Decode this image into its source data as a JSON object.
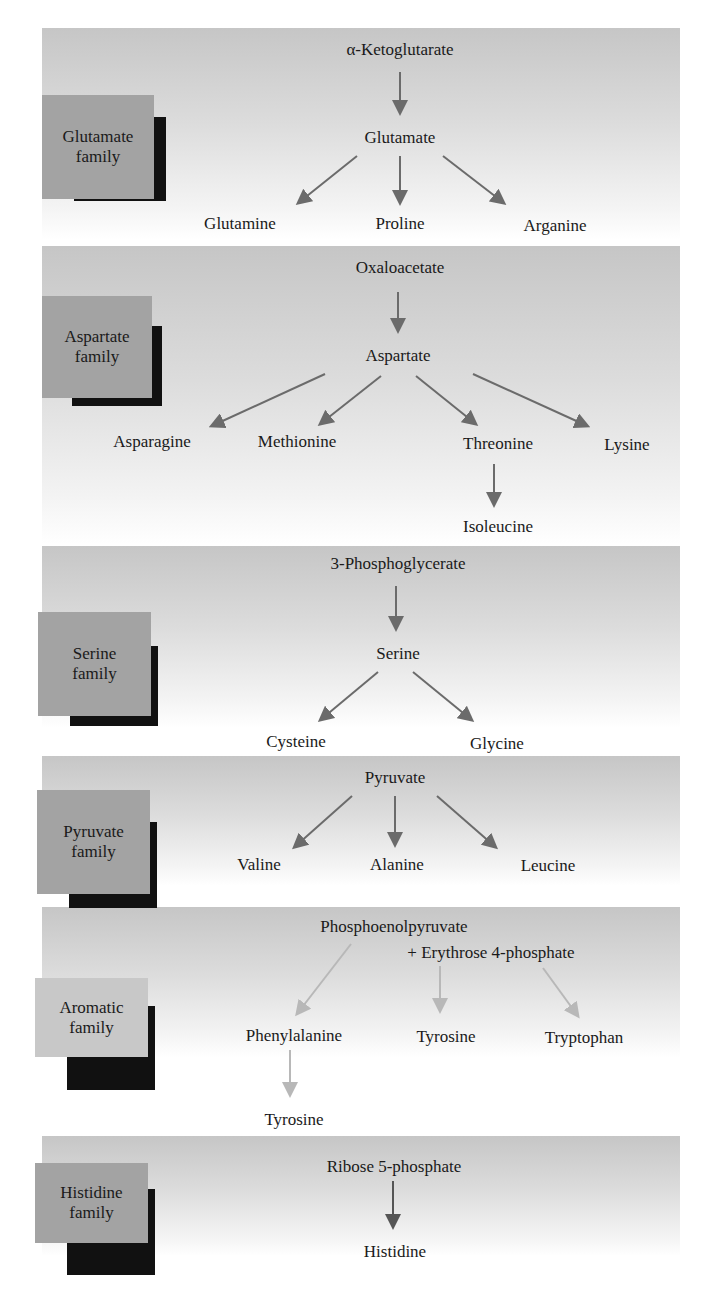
{
  "colors": {
    "badge_default": "#a3a3a3",
    "badge_aromatic": "#c8c8c8",
    "badge_shadow": "#111111",
    "arrow_default": "#6b6b6b",
    "arrow_aromatic": "#b8b8b8",
    "arrow_histidine": "#555555"
  },
  "families": [
    {
      "name": "Glutamate family",
      "badge": [
        "Glutamate",
        "family"
      ],
      "precursor": [
        "α-Ketoglutarate"
      ],
      "intermediate": "Glutamate",
      "products": [
        "Glutamine",
        "Proline",
        "Arganine"
      ]
    },
    {
      "name": "Aspartate family",
      "badge": [
        "Aspartate",
        "family"
      ],
      "precursor": [
        "Oxaloacetate"
      ],
      "intermediate": "Aspartate",
      "products": [
        "Asparagine",
        "Methionine",
        "Threonine",
        "Lysine"
      ],
      "secondary": [
        {
          "from": "Threonine",
          "to": "Isoleucine"
        }
      ]
    },
    {
      "name": "Serine family",
      "badge": [
        "Serine",
        "family"
      ],
      "precursor": [
        "3-Phosphoglycerate"
      ],
      "intermediate": "Serine",
      "products": [
        "Cysteine",
        "Glycine"
      ]
    },
    {
      "name": "Pyruvate family",
      "badge": [
        "Pyruvate",
        "family"
      ],
      "precursor": [
        "Pyruvate"
      ],
      "products": [
        "Valine",
        "Alanine",
        "Leucine"
      ]
    },
    {
      "name": "Aromatic family",
      "badge": [
        "Aromatic",
        "family"
      ],
      "precursor": [
        "Phosphoenolpyruvate",
        "+ Erythrose 4-phosphate"
      ],
      "products": [
        "Phenylalanine",
        "Tyrosine",
        "Tryptophan"
      ],
      "secondary": [
        {
          "from": "Phenylalanine",
          "to": "Tyrosine"
        }
      ]
    },
    {
      "name": "Histidine family",
      "badge": [
        "Histidine",
        "family"
      ],
      "precursor": [
        "Ribose 5-phosphate"
      ],
      "products": [
        "Histidine"
      ]
    }
  ]
}
